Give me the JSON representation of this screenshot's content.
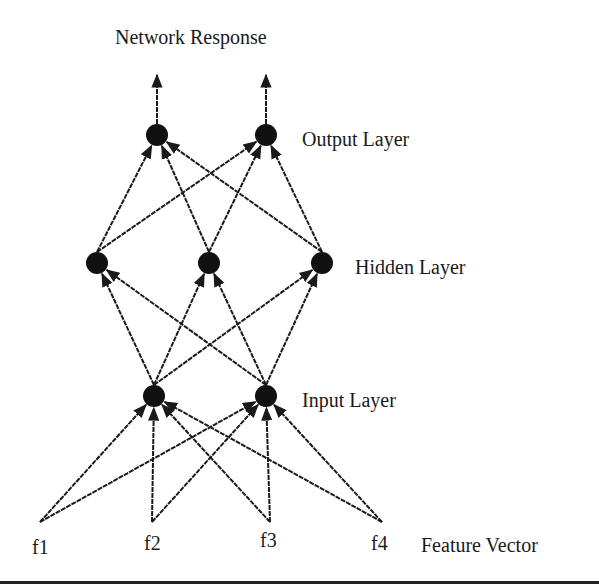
{
  "diagram": {
    "title": "Network Response",
    "layers": {
      "output": {
        "label": "Output Layer",
        "nodes": [
          {
            "id": "o1",
            "x": 157,
            "y": 135
          },
          {
            "id": "o2",
            "x": 266,
            "y": 135
          }
        ]
      },
      "hidden": {
        "label": "Hidden Layer",
        "nodes": [
          {
            "id": "h1",
            "x": 97,
            "y": 263
          },
          {
            "id": "h2",
            "x": 209,
            "y": 263
          },
          {
            "id": "h3",
            "x": 322,
            "y": 263
          }
        ]
      },
      "input": {
        "label": "Input Layer",
        "nodes": [
          {
            "id": "i1",
            "x": 154,
            "y": 396
          },
          {
            "id": "i2",
            "x": 266,
            "y": 396
          }
        ]
      },
      "features": {
        "label": "Feature Vector",
        "items": [
          {
            "id": "f1",
            "label": "f1",
            "x": 40,
            "y": 522
          },
          {
            "id": "f2",
            "label": "f2",
            "x": 152,
            "y": 522
          },
          {
            "id": "f3",
            "label": "f3",
            "x": 270,
            "y": 522
          },
          {
            "id": "f4",
            "label": "f4",
            "x": 382,
            "y": 522
          }
        ]
      }
    },
    "edges_description": "fully connected feed-forward: features -> input -> hidden -> output -> response",
    "colors": {
      "node": "#111111",
      "edge": "#1a1a1a",
      "background": "#ffffff"
    }
  }
}
